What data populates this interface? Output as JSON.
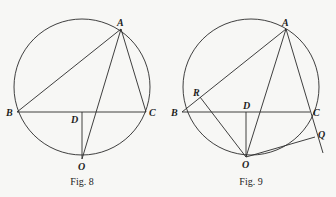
{
  "figures": [
    {
      "id": "fig8",
      "caption": "Fig. 8",
      "circle": {
        "cx": 82,
        "cy": 87,
        "r": 68
      },
      "points": {
        "A": {
          "label": "A",
          "x": 121,
          "y": 29
        },
        "B": {
          "label": "B",
          "x": 17,
          "y": 112
        },
        "C": {
          "label": "C",
          "x": 146,
          "y": 112
        },
        "D": {
          "label": "D",
          "x": 82,
          "y": 112
        },
        "O": {
          "label": "O",
          "x": 82,
          "y": 159
        }
      },
      "segments": [
        [
          "A",
          "B"
        ],
        [
          "A",
          "C"
        ],
        [
          "B",
          "C"
        ],
        [
          "A",
          "O"
        ],
        [
          "D",
          "O"
        ]
      ]
    },
    {
      "id": "fig9",
      "caption": "Fig. 9",
      "circle": {
        "cx": 251,
        "cy": 87,
        "r": 68
      },
      "points": {
        "A": {
          "label": "A",
          "x": 286,
          "y": 29
        },
        "B": {
          "label": "B",
          "x": 182,
          "y": 112
        },
        "C": {
          "label": "C",
          "x": 310,
          "y": 112
        },
        "D": {
          "label": "D",
          "x": 246,
          "y": 112
        },
        "O": {
          "label": "O",
          "x": 246,
          "y": 157
        },
        "R": {
          "label": "R",
          "x": 200,
          "y": 97
        },
        "Q": {
          "label": "Q",
          "x": 315,
          "y": 137
        }
      },
      "segments": [
        [
          "A",
          "B"
        ],
        [
          "B",
          "C"
        ],
        [
          "A",
          "O"
        ],
        [
          "D",
          "O"
        ],
        [
          "R",
          "O"
        ],
        [
          "O",
          "Q"
        ]
      ],
      "extended_line": {
        "from": "A",
        "through": "C",
        "end": {
          "x": 323,
          "y": 153
        }
      }
    }
  ],
  "labels": {
    "fig8": {
      "A": "A",
      "B": "B",
      "C": "C",
      "D": "D",
      "O": "O",
      "caption": "Fig. 8"
    },
    "fig9": {
      "A": "A",
      "B": "B",
      "C": "C",
      "D": "D",
      "O": "O",
      "R": "R",
      "Q": "Q",
      "caption": "Fig. 9"
    }
  }
}
